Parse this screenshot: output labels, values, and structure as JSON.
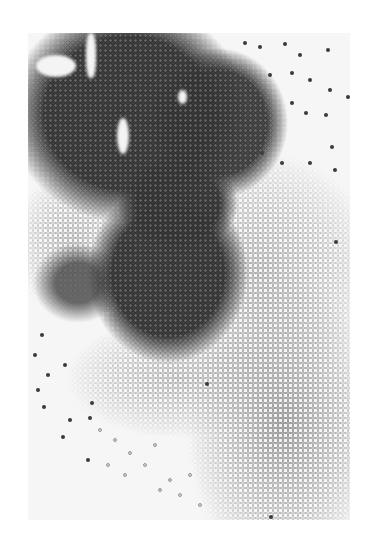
{
  "image": {
    "subject": "Grayscale photograph of dark and light round beads/seeds spread across a white surface",
    "regions": {
      "dark_mass": "upper-left to center",
      "light_mass": "lower-right and left-middle",
      "scattered": "dark beads scattered toward upper-right and lower-left"
    },
    "colors": {
      "background": "#ffffff",
      "surface": "#f6f6f6",
      "dark_bead": "#3a3a3a",
      "light_bead": "#cfcfcf"
    }
  }
}
